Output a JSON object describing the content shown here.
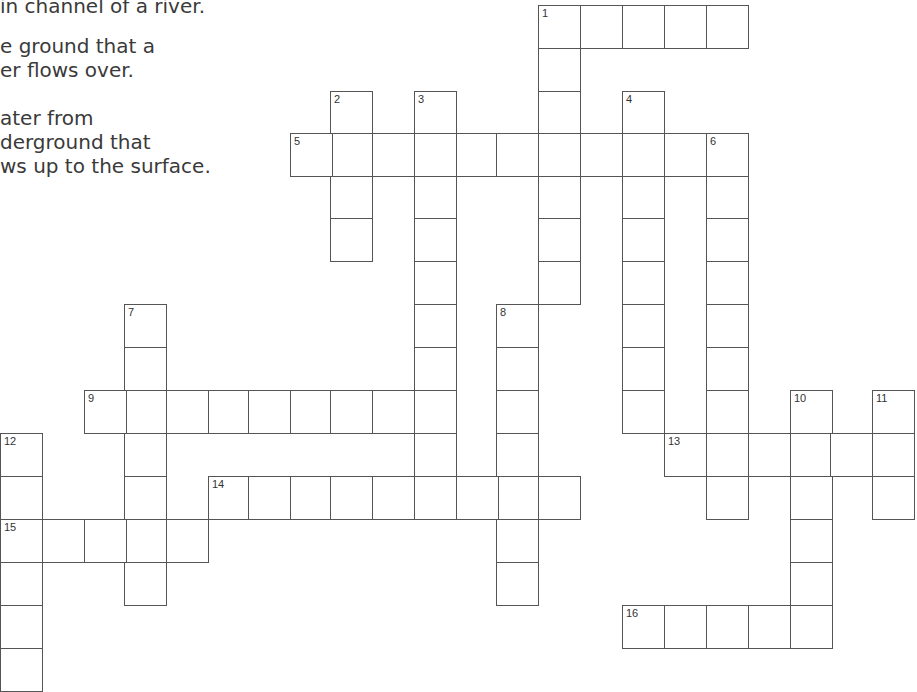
{
  "clues_partial": {
    "lines": [
      {
        "text": "in channel of a river.",
        "top": -6
      },
      {
        "text": "e ground that a",
        "top": 34
      },
      {
        "text": "er flows over.",
        "top": 58
      },
      {
        "text": "ater from",
        "top": 106
      },
      {
        "text": "derground that",
        "top": 130
      },
      {
        "text": "ws up to the surface.",
        "top": 154
      }
    ]
  },
  "grid": {
    "cell_size": 42,
    "cols_x": [
      0,
      42,
      84,
      124,
      166,
      208,
      248,
      290,
      330,
      372,
      414,
      456,
      496,
      538,
      580,
      622,
      664,
      706,
      748,
      790,
      830,
      872
    ],
    "rows_y": [
      5,
      48,
      91,
      133,
      176,
      218,
      261,
      304,
      347,
      390,
      433,
      476,
      519,
      562,
      605,
      648
    ],
    "words": [
      {
        "number": "1",
        "direction": "across",
        "row": 0,
        "col": 13,
        "length": 5
      },
      {
        "number": "1",
        "direction": "down",
        "row": 0,
        "col": 13,
        "length": 7
      },
      {
        "number": "2",
        "direction": "down",
        "row": 2,
        "col": 8,
        "length": 4
      },
      {
        "number": "3",
        "direction": "down",
        "row": 2,
        "col": 10,
        "length": 9
      },
      {
        "number": "4",
        "direction": "down",
        "row": 2,
        "col": 15,
        "length": 8
      },
      {
        "number": "5",
        "direction": "across",
        "row": 3,
        "col": 7,
        "length": 11
      },
      {
        "number": "6",
        "direction": "down",
        "row": 3,
        "col": 17,
        "length": 9
      },
      {
        "number": "7",
        "direction": "down",
        "row": 7,
        "col": 3,
        "length": 7
      },
      {
        "number": "8",
        "direction": "down",
        "row": 7,
        "col": 12,
        "length": 7
      },
      {
        "number": "9",
        "direction": "across",
        "row": 9,
        "col": 2,
        "length": 9
      },
      {
        "number": "10",
        "direction": "down",
        "row": 9,
        "col": 19,
        "length": 6
      },
      {
        "number": "11",
        "direction": "down",
        "row": 9,
        "col": 21,
        "length": 3
      },
      {
        "number": "12",
        "direction": "down",
        "row": 10,
        "col": 0,
        "length": 6
      },
      {
        "number": "13",
        "direction": "across",
        "row": 10,
        "col": 16,
        "length": 6
      },
      {
        "number": "14",
        "direction": "across",
        "row": 11,
        "col": 5,
        "length": 9
      },
      {
        "number": "15",
        "direction": "across",
        "row": 12,
        "col": 0,
        "length": 5
      },
      {
        "number": "16",
        "direction": "across",
        "row": 14,
        "col": 15,
        "length": 5
      }
    ]
  }
}
